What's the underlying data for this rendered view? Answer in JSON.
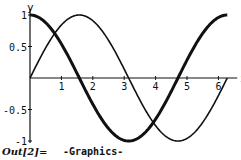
{
  "chart_data": {
    "type": "line",
    "title": "",
    "xlabel": "x",
    "ylabel": "y",
    "xlim": [
      0,
      6.2832
    ],
    "ylim": [
      -1,
      1
    ],
    "x_ticks": [
      "1",
      "2",
      "3",
      "4",
      "5",
      "6"
    ],
    "y_ticks": [
      "1",
      "0.5",
      "-0.5",
      "-1"
    ],
    "grid": false,
    "legend": null,
    "series": [
      {
        "name": "sin(x)",
        "style": "thin",
        "x": [
          0,
          0.785,
          1.571,
          2.356,
          3.142,
          3.927,
          4.712,
          5.498,
          6.283
        ],
        "values": [
          0,
          0.707,
          1,
          0.707,
          0,
          -0.707,
          -1,
          -0.707,
          0
        ]
      },
      {
        "name": "cos(x)",
        "style": "thick",
        "x": [
          0,
          0.785,
          1.571,
          2.356,
          3.142,
          3.927,
          4.712,
          5.498,
          6.283
        ],
        "values": [
          1,
          0.707,
          0,
          -0.707,
          -1,
          -0.707,
          0,
          0.707,
          1
        ]
      }
    ]
  },
  "output": {
    "label": "Out[2]=",
    "value": "-Graphics-"
  },
  "axes": {
    "x_label": "x",
    "y_label": "y"
  }
}
